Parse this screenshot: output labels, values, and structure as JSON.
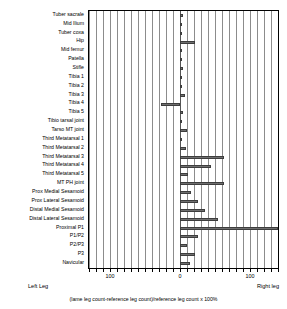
{
  "chart_data": {
    "type": "bar",
    "orientation": "horizontal",
    "title": "",
    "xlabel": "(lame leg count-reference leg count)/reference leg count  x 100%",
    "ylabel": "",
    "xlim": [
      -130,
      140
    ],
    "grid": true,
    "grid_spacing": 10,
    "legend": "none",
    "axis_ticks": [
      {
        "label": "100",
        "value": -100
      },
      {
        "label": "0",
        "value": 0
      },
      {
        "label": "100",
        "value": 100
      }
    ],
    "side_labels": {
      "left": "Left Leg",
      "right": "Right leg"
    },
    "categories": [
      "Tuber sacrale",
      "Mid Ilium",
      "Tuber coxa",
      "Hip",
      "Mid femur",
      "Patella",
      "Stifle",
      "Tibia 1",
      "Tibia 2",
      "Tibia 3",
      "Tibia 4",
      "Tibia 5",
      "Tibio tarsal joint",
      "Tarso MT joint",
      "Third Metatarsal 1",
      "Third Metatarsal 2",
      "Third Metatarsal 3",
      "Third Metatarsal 4",
      "Third Metatarsal 5",
      "MT PH joint",
      "Prox Medial Sesamoid",
      "Prox Lateral Sesamoid",
      "Distal Medial Sesamoid",
      "Distal Lateral Sesamoid",
      "Proximal P1",
      "P1/P2",
      "P2/P3",
      "P3",
      "Navicular"
    ],
    "values": [
      4,
      2,
      3,
      22,
      3,
      3,
      4,
      3,
      2,
      7,
      -27,
      4,
      3,
      10,
      2,
      9,
      63,
      44,
      11,
      63,
      15,
      25,
      35,
      54,
      140,
      25,
      10,
      21,
      14
    ]
  }
}
